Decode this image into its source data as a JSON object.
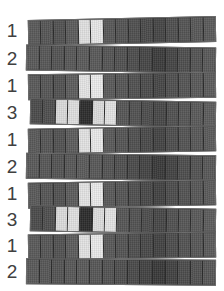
{
  "figure": {
    "background_color": "#ffffff",
    "label_color": "#404040",
    "strip_border_color": "#6e6e6e",
    "cell_divider_color": "#2b2b2b",
    "columns": 15,
    "palette": {
      "very_dark": "#2f2f2f",
      "dark": "#474747",
      "medium_dark": "#555555",
      "medium": "#5f5f5f",
      "light": "#dcdcdc",
      "very_light": "#e8e8e8"
    },
    "rows": [
      {
        "label": "1",
        "top": 18,
        "left": 28,
        "width": 188,
        "height": 26,
        "rotate": -1.2,
        "cells": [
          "#5a5a5a",
          "#565656",
          "#525252",
          "#5c5c5c",
          "#e2e2e2",
          "#e8e8e8",
          "#585858",
          "#545454",
          "#505050",
          "#4b4b4b",
          "#464646",
          "#4f4f4f",
          "#545454",
          "#585858",
          "#5b5b5b"
        ]
      },
      {
        "label": "2",
        "top": 46,
        "left": 26,
        "width": 190,
        "height": 26,
        "rotate": 0.9,
        "cells": [
          "#5a5a5a",
          "#575757",
          "#545454",
          "#585858",
          "#5b5b5b",
          "#595959",
          "#555555",
          "#515151",
          "#4d4d4d",
          "#464646",
          "#3c3c3c",
          "#454545",
          "#4e4e4e",
          "#545454",
          "#595959"
        ]
      },
      {
        "label": "1",
        "top": 73,
        "left": 28,
        "width": 188,
        "height": 26,
        "rotate": -0.8,
        "cells": [
          "#5a5a5a",
          "#565656",
          "#525252",
          "#5e5e5e",
          "#e6e6e6",
          "#ececec",
          "#5a5a5a",
          "#565656",
          "#515151",
          "#4c4c4c",
          "#474747",
          "#505050",
          "#555555",
          "#595959",
          "#5c5c5c"
        ]
      },
      {
        "label": "3",
        "top": 100,
        "left": 30,
        "width": 186,
        "height": 26,
        "rotate": 1.1,
        "cells": [
          "#4b4b4b",
          "#4f4f4f",
          "#dcdcdc",
          "#e0e0e0",
          "#2d2d2d",
          "#dedede",
          "#e4e4e4",
          "#565656",
          "#525252",
          "#4d4d4d",
          "#484848",
          "#515151",
          "#565656",
          "#5a5a5a",
          "#5d5d5d"
        ]
      },
      {
        "label": "1",
        "top": 127,
        "left": 28,
        "width": 188,
        "height": 26,
        "rotate": -1.0,
        "cells": [
          "#5a5a5a",
          "#565656",
          "#525252",
          "#5d5d5d",
          "#e4e4e4",
          "#eaeaea",
          "#595959",
          "#555555",
          "#505050",
          "#4a4a4a",
          "#444444",
          "#4e4e4e",
          "#545454",
          "#585858",
          "#5b5b5b"
        ]
      },
      {
        "label": "2",
        "top": 154,
        "left": 26,
        "width": 190,
        "height": 26,
        "rotate": 0.8,
        "cells": [
          "#5a5a5a",
          "#575757",
          "#545454",
          "#585858",
          "#5b5b5b",
          "#585858",
          "#545454",
          "#505050",
          "#4b4b4b",
          "#444444",
          "#3a3a3a",
          "#434343",
          "#4d4d4d",
          "#535353",
          "#585858"
        ]
      },
      {
        "label": "1",
        "top": 181,
        "left": 28,
        "width": 188,
        "height": 26,
        "rotate": -1.0,
        "cells": [
          "#5a5a5a",
          "#565656",
          "#525252",
          "#5d5d5d",
          "#e5e5e5",
          "#ebebeb",
          "#595959",
          "#555555",
          "#4f4f4f",
          "#494949",
          "#434343",
          "#4d4d4d",
          "#535353",
          "#575757",
          "#5b5b5b"
        ]
      },
      {
        "label": "3",
        "top": 207,
        "left": 30,
        "width": 186,
        "height": 26,
        "rotate": 1.1,
        "cells": [
          "#4b4b4b",
          "#4f4f4f",
          "#dddddd",
          "#e1e1e1",
          "#2c2c2c",
          "#dfdfdf",
          "#e5e5e5",
          "#565656",
          "#525252",
          "#4d4d4d",
          "#484848",
          "#515151",
          "#565656",
          "#5a5a5a",
          "#5d5d5d"
        ]
      },
      {
        "label": "1",
        "top": 233,
        "left": 28,
        "width": 188,
        "height": 26,
        "rotate": -0.9,
        "cells": [
          "#5a5a5a",
          "#565656",
          "#525252",
          "#5d5d5d",
          "#e4e4e4",
          "#eaeaea",
          "#585858",
          "#545454",
          "#4f4f4f",
          "#494949",
          "#434343",
          "#4d4d4d",
          "#535353",
          "#575757",
          "#5b5b5b"
        ]
      },
      {
        "label": "2",
        "top": 259,
        "left": 26,
        "width": 190,
        "height": 26,
        "rotate": 0.4,
        "cells": [
          "#5a5a5a",
          "#575757",
          "#545454",
          "#585858",
          "#5a5a5a",
          "#575757",
          "#535353",
          "#4f4f4f",
          "#4a4a4a",
          "#434343",
          "#393939",
          "#424242",
          "#4c4c4c",
          "#525252",
          "#575757"
        ]
      }
    ]
  }
}
